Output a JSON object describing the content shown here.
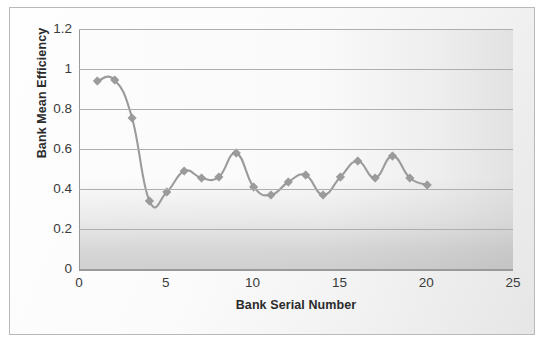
{
  "chart_data": {
    "type": "line",
    "title": "",
    "xlabel": "Bank Serial Number",
    "ylabel": "Bank Mean Efficiency",
    "x": [
      1,
      2,
      3,
      4,
      5,
      6,
      7,
      8,
      9,
      10,
      11,
      12,
      13,
      14,
      15,
      16,
      17,
      18,
      19,
      20
    ],
    "values": [
      0.94,
      0.945,
      0.755,
      0.34,
      0.385,
      0.49,
      0.455,
      0.46,
      0.58,
      0.41,
      0.37,
      0.435,
      0.47,
      0.37,
      0.46,
      0.54,
      0.455,
      0.565,
      0.455,
      0.42
    ],
    "series": [
      {
        "name": "Bank Mean Efficiency",
        "values": [
          0.94,
          0.945,
          0.755,
          0.34,
          0.385,
          0.49,
          0.455,
          0.46,
          0.58,
          0.41,
          0.37,
          0.435,
          0.47,
          0.37,
          0.46,
          0.54,
          0.455,
          0.565,
          0.455,
          0.42
        ]
      }
    ],
    "xlim": [
      0,
      25
    ],
    "ylim": [
      0,
      1.2
    ],
    "xticks": [
      "0",
      "5",
      "10",
      "15",
      "20",
      "25"
    ],
    "xtick_values": [
      0,
      5,
      10,
      15,
      20,
      25
    ],
    "yticks": [
      "0",
      "0.2",
      "0.4",
      "0.6",
      "0.8",
      "1",
      "1.2"
    ],
    "ytick_values": [
      0,
      0.2,
      0.4,
      0.6,
      0.8,
      1,
      1.2
    ],
    "grid": "horizontal",
    "legend": "none",
    "marker": "diamond",
    "line_color": "#9b9b9b",
    "marker_color": "#9b9b9b",
    "gridline_color": "#aeaeae",
    "border_color": "#b9b9b9",
    "plot_background": "#fafafa"
  }
}
